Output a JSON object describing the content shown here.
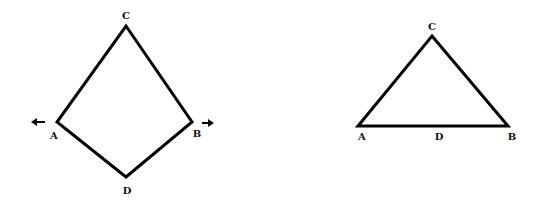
{
  "figure_left": {
    "shape": "kite",
    "vertices": {
      "C": {
        "label": "C",
        "x": 126,
        "y": 26
      },
      "A": {
        "label": "A",
        "x": 57,
        "y": 122
      },
      "B": {
        "label": "B",
        "x": 192,
        "y": 122
      },
      "D": {
        "label": "D",
        "x": 126,
        "y": 177
      }
    },
    "arrows": [
      {
        "name": "arrow-left",
        "direction": "left",
        "at": "A"
      },
      {
        "name": "arrow-right",
        "direction": "right",
        "at": "B"
      }
    ]
  },
  "figure_right": {
    "shape": "triangle",
    "vertices": {
      "C": {
        "label": "C",
        "x": 432,
        "y": 36
      },
      "A": {
        "label": "A",
        "x": 358,
        "y": 126
      },
      "B": {
        "label": "B",
        "x": 508,
        "y": 126
      }
    },
    "points_on_base": {
      "D": {
        "label": "D"
      }
    }
  },
  "colors": {
    "stroke": "#000000",
    "background": "#ffffff"
  }
}
